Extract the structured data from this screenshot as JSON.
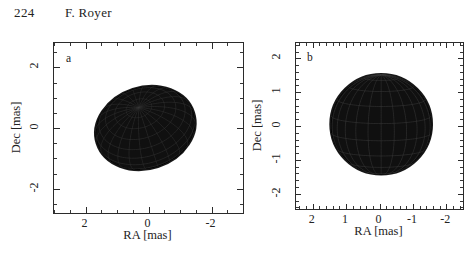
{
  "running_head": {
    "page_number": "224",
    "author": "F. Royer"
  },
  "figure": {
    "panels": [
      {
        "letter": "a",
        "name": "inclined-oblate-star",
        "xaxis": {
          "title": "RA [mas]",
          "ticks": [
            2,
            0,
            -2
          ],
          "tick_labels": [
            "2",
            "0",
            "-2"
          ],
          "range": [
            3.0,
            -3.0
          ],
          "minor_step": 0.5,
          "inverted": true
        },
        "yaxis": {
          "title": "Dec [mas]",
          "ticks": [
            2,
            0,
            -2
          ],
          "tick_labels": [
            "2",
            "0",
            "-2"
          ],
          "range": [
            -2.8,
            2.8
          ],
          "minor_step": 0.5
        }
      },
      {
        "letter": "b",
        "name": "pole-on-star",
        "xaxis": {
          "title": "RA [mas]",
          "ticks": [
            2,
            1,
            0,
            -1,
            -2
          ],
          "tick_labels": [
            "2",
            "1",
            "0",
            "-1",
            "-2"
          ],
          "range": [
            2.5,
            -2.5
          ],
          "minor_step": 0.2,
          "inverted": true
        },
        "yaxis": {
          "title": "Dec [mas]",
          "ticks": [
            2,
            1,
            0,
            -1,
            -2
          ],
          "tick_labels": [
            "2",
            "1",
            "0",
            "-1",
            "-2"
          ],
          "range": [
            -2.45,
            2.45
          ],
          "minor_step": 0.2
        }
      }
    ]
  },
  "chart_data": {
    "type": "scatter",
    "title": "",
    "xlabel": "RA [mas]",
    "ylabel": "Dec [mas]",
    "panels": [
      {
        "label": "a",
        "view": "inclined",
        "center": [
          0.1,
          0.0
        ],
        "semi_major_mas": 1.62,
        "semi_minor_mas": 1.35,
        "rotation_deg": -18,
        "pole_position": [
          0.85,
          -0.55
        ],
        "grid_meridians": 24,
        "grid_parallels": 12,
        "surface_color": "#101010",
        "xlim": [
          3.0,
          -3.0
        ],
        "ylim": [
          -2.8,
          2.8
        ],
        "grid": false
      },
      {
        "label": "b",
        "view": "pole-on",
        "center": [
          -0.05,
          0.05
        ],
        "semi_major_mas": 1.52,
        "semi_minor_mas": 1.48,
        "rotation_deg": 0,
        "pole_position": [
          -0.3,
          0.2
        ],
        "grid_meridians": 24,
        "grid_parallels": 9,
        "surface_color": "#101010",
        "xlim": [
          2.5,
          -2.5
        ],
        "ylim": [
          -2.45,
          2.45
        ],
        "grid": false
      }
    ],
    "legend": null,
    "legend_position": "none"
  },
  "colors": {
    "axis": "#2b2b2b",
    "text": "#232323",
    "surface": "#101010",
    "background": "#ffffff"
  }
}
